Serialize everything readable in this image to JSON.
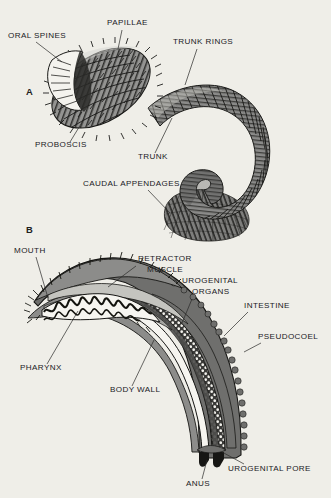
{
  "plate": {
    "background_color": "#efeee8",
    "ink_color": "#20201e",
    "gray_body": "#8b8b89",
    "gray_dark": "#4a4a48",
    "gray_light": "#b9b9b5",
    "white_fill": "#f6f5f0"
  },
  "panels": [
    {
      "letter": "A",
      "name": "external-morphology",
      "labels": [
        {
          "id": "oral-spines",
          "text": "ORAL SPINES",
          "x": 8,
          "y": 38,
          "anchor": "start"
        },
        {
          "id": "papillae",
          "text": "PAPILLAE",
          "x": 107,
          "y": 25,
          "anchor": "start"
        },
        {
          "id": "trunk-rings",
          "text": "TRUNK RINGS",
          "x": 173,
          "y": 44,
          "anchor": "start"
        },
        {
          "id": "proboscis",
          "text": "PROBOSCIS",
          "x": 35,
          "y": 147,
          "anchor": "start"
        },
        {
          "id": "trunk",
          "text": "TRUNK",
          "x": 138,
          "y": 159,
          "anchor": "start"
        },
        {
          "id": "caudal-appendages",
          "text": "CAUDAL APPENDAGES",
          "x": 83,
          "y": 186,
          "anchor": "start"
        }
      ]
    },
    {
      "letter": "B",
      "name": "sagittal-section",
      "labels": [
        {
          "id": "mouth",
          "text": "MOUTH",
          "x": 14,
          "y": 253,
          "anchor": "start"
        },
        {
          "id": "retractor-muscle",
          "text": "RETRACTOR",
          "x": 138,
          "y": 261,
          "anchor": "start"
        },
        {
          "id": "retractor-muscle2",
          "text": "MUSCLE",
          "x": 147,
          "y": 272,
          "anchor": "start"
        },
        {
          "id": "urogenital-organs",
          "text": "UROGENITAL",
          "x": 182,
          "y": 283,
          "anchor": "start"
        },
        {
          "id": "urogenital-organs2",
          "text": "ORGANS",
          "x": 192,
          "y": 294,
          "anchor": "start"
        },
        {
          "id": "intestine",
          "text": "INTESTINE",
          "x": 244,
          "y": 308,
          "anchor": "start"
        },
        {
          "id": "pseudocoel",
          "text": "PSEUDOCOEL",
          "x": 263,
          "y": 339,
          "anchor": "start"
        },
        {
          "id": "pharynx",
          "text": "PHARYNX",
          "x": 20,
          "y": 370,
          "anchor": "start"
        },
        {
          "id": "body-wall",
          "text": "BODY WALL",
          "x": 110,
          "y": 392,
          "anchor": "start"
        },
        {
          "id": "anus",
          "text": "ANUS",
          "x": 192,
          "y": 484,
          "anchor": "start"
        },
        {
          "id": "urogenital-pore",
          "text": "UROGENITAL PORE",
          "x": 230,
          "y": 470,
          "anchor": "start"
        }
      ]
    }
  ],
  "structures": {
    "a_proboscis": "ovoid anterior bulb covered in diagonal rows of spiny papillae",
    "a_oral_spines": "ring of pale spines at anterior tip of proboscis",
    "a_trunk": "curved annulated tube bearing many transverse trunk rings",
    "a_caudal_appendages": "fan-shaped skirt of finger-like projections at posterior end",
    "b_mouth": "anterior opening between two spiny jaw flaps",
    "b_pharynx": "wavy zigzag-walled anterior gut chamber",
    "b_retractor_muscle": "pale band running inside dorsal body wall",
    "b_body_wall": "dark scalloped outer layer enclosing the animal",
    "b_pseudocoel": "stippled vesicular body cavity between gut and body wall",
    "b_intestine": "long pale tube running to posterior anus",
    "b_urogenital_organs": "paired organs opening at urogenital pore",
    "b_anus": "posterior terminal opening of intestine",
    "b_urogenital_pore": "posterior opening beside the anus"
  }
}
